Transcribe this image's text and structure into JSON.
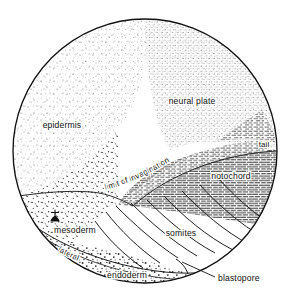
{
  "figure": {
    "kind": "embryo-fate-map-diagram",
    "view": "dorsal view of amphibian gastrula / neurula fate map",
    "outline_shape": "circle",
    "background_color": "#ffffff",
    "ink_color": "#101010"
  },
  "labels": {
    "epidermis": "epidermis",
    "neural_plate": "neural plate",
    "tail": "tail",
    "notochord": "notochord",
    "limit_of_invagination": "limit  of  invagination",
    "somites": "somites",
    "mesoderm": "mesoderm",
    "lateral": "lateral",
    "endoderm": "endoderm",
    "blastopore": "blastopore"
  },
  "regions": [
    {
      "name": "epidermis",
      "label": "epidermis",
      "fill_pattern": "sparse-stipple",
      "label_x": 62,
      "label_y": 128
    },
    {
      "name": "neural-plate",
      "label": "neural plate",
      "fill_pattern": "dense-stipple",
      "label_x": 192,
      "label_y": 104
    },
    {
      "name": "tail",
      "label": "tail",
      "fill_pattern": "horizontal-dash-hatch",
      "label_x": 263,
      "label_y": 146
    },
    {
      "name": "notochord",
      "label": "notochord",
      "fill_pattern": "horizontal-dash-hatch",
      "label_x": 230,
      "label_y": 178
    },
    {
      "name": "somites",
      "label": "somites",
      "fill_pattern": "curved-arc-lines",
      "label_x": 181,
      "label_y": 235
    },
    {
      "name": "mesoderm",
      "label": "mesoderm",
      "fill_pattern": "coarse-stipple",
      "label_x": 75,
      "label_y": 232
    },
    {
      "name": "lateral",
      "label": "lateral",
      "fill_pattern": "coarse-stipple",
      "label_x": 80,
      "label_y": 257
    },
    {
      "name": "endoderm",
      "label": "endoderm",
      "fill_pattern": "coarse-stipple-band",
      "label_x": 124,
      "label_y": 277
    }
  ],
  "boundaries": [
    {
      "name": "limit-of-invagination",
      "label": "limit  of  invagination",
      "type": "curve-with-rotated-text"
    }
  ],
  "callouts": [
    {
      "name": "blastopore",
      "label": "blastopore",
      "label_x": 218,
      "label_y": 280,
      "leader_from_x": 212,
      "leader_from_y": 275,
      "leader_to_x": 182,
      "leader_to_y": 262
    }
  ],
  "markers": [
    {
      "name": "mesoderm-marker",
      "shape": "small-filled-anchor-glyph",
      "x": 55,
      "y": 215
    }
  ]
}
